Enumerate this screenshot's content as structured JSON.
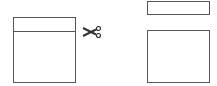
{
  "diagram": {
    "before": {
      "shape": "square-with-top-strip",
      "cut_marker": "scissors-icon"
    },
    "after": {
      "pieces": [
        "thin-strip",
        "remaining-rectangle"
      ]
    },
    "colors": {
      "stroke": "#555555",
      "background": "#ffffff"
    }
  }
}
